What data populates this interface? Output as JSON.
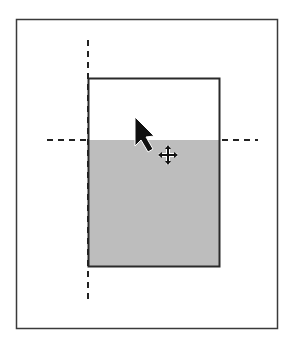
{
  "diagram": {
    "colors": {
      "background": "#ffffff",
      "frame_stroke": "#3a3a3a",
      "object_stroke": "#2a2a2a",
      "object_fill_lower": "#bdbdbd",
      "guide_stroke": "#222222",
      "cursor_fill": "#111111"
    },
    "page_frame": {
      "x": 16,
      "y": 19,
      "width": 262,
      "height": 310
    },
    "object_rect": {
      "x": 88,
      "y": 78,
      "width": 132,
      "height": 189
    },
    "shaded_region": {
      "x": 88,
      "y": 140,
      "width": 132,
      "height": 127
    },
    "guides": {
      "vertical": {
        "x": 88,
        "y1": 40,
        "y2": 302
      },
      "horizontal": {
        "y": 140,
        "x1": 47,
        "x2": 258
      }
    },
    "cursor": {
      "type": "arrow-pointer",
      "tip_x": 135,
      "tip_y": 117
    },
    "move_icon": {
      "type": "move-cross",
      "cx": 168,
      "cy": 155,
      "size": 18
    }
  }
}
